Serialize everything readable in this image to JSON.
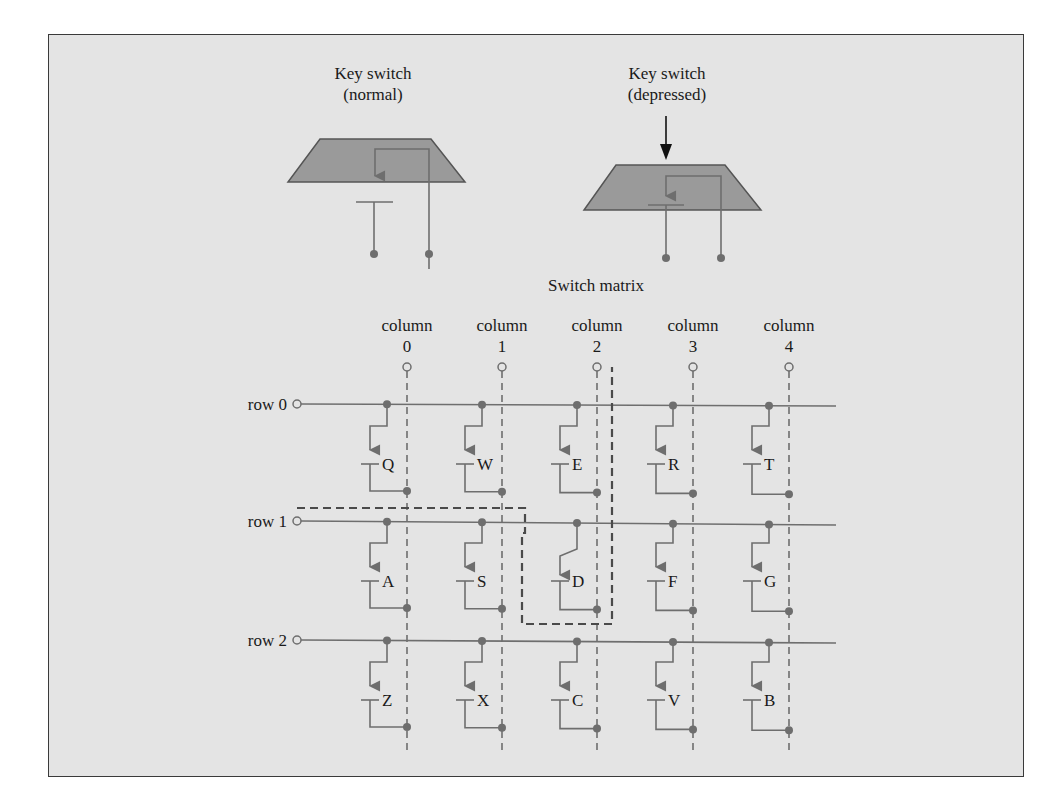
{
  "figure": {
    "colors": {
      "background": "#e4e4e4",
      "frame": "#3a3a3a",
      "wire": "#6e6e6e",
      "keycap": "#9a9a9a",
      "text": "#1a1a1a",
      "dashed_path": "#4a4a4a"
    },
    "key_switch_normal": {
      "title_line1": "Key switch",
      "title_line2": "(normal)"
    },
    "key_switch_depressed": {
      "title_line1": "Key switch",
      "title_line2": "(depressed)"
    },
    "matrix": {
      "title": "Switch matrix",
      "column_word": "column",
      "columns": [
        {
          "label": "column",
          "index": "0"
        },
        {
          "label": "column",
          "index": "1"
        },
        {
          "label": "column",
          "index": "2"
        },
        {
          "label": "column",
          "index": "3"
        },
        {
          "label": "column",
          "index": "4"
        }
      ],
      "rows": [
        {
          "label": "row 0",
          "keys": [
            "Q",
            "W",
            "E",
            "R",
            "T"
          ]
        },
        {
          "label": "row 1",
          "keys": [
            "A",
            "S",
            "D",
            "F",
            "G"
          ]
        },
        {
          "label": "row 2",
          "keys": [
            "Z",
            "X",
            "C",
            "V",
            "B"
          ]
        }
      ],
      "highlighted_path": {
        "from_row": "row 1",
        "through_key": "D",
        "to_column": "2"
      }
    }
  }
}
